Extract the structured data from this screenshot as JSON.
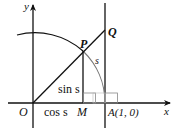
{
  "diagram": {
    "type": "unit-circle-trig",
    "labels": {
      "y_axis": "y",
      "x_axis": "x",
      "origin": "O",
      "point_p": "P",
      "point_q": "Q",
      "point_m": "M",
      "point_a": "A(1, 0)",
      "arc_length": "s",
      "sin_segment": "sin s",
      "cos_segment": "cos s"
    },
    "colors": {
      "line": "#111111",
      "arc": "#111111",
      "arc_right": "#777777",
      "right_angle_box": "#888888"
    }
  }
}
